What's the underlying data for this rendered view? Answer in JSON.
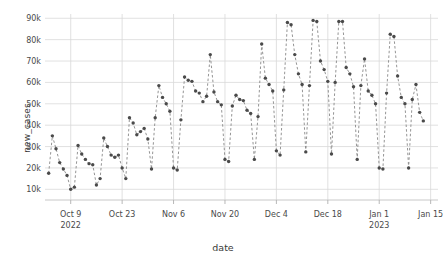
{
  "chart_data": {
    "type": "scatter",
    "title": "",
    "xlabel": "date",
    "ylabel": "new_cases",
    "ylim": [
      5000,
      92000
    ],
    "ytick_values": [
      10000,
      20000,
      30000,
      40000,
      50000,
      60000,
      70000,
      80000,
      90000
    ],
    "ytick_labels": [
      "10k",
      "20k",
      "30k",
      "40k",
      "50k",
      "60k",
      "70k",
      "80k",
      "90k"
    ],
    "xtick_labels": [
      "Oct 9\n2022",
      "Oct 23",
      "Nov 6",
      "Nov 20",
      "Dec 4",
      "Dec 18",
      "Jan 1\n2023",
      "Jan 15"
    ],
    "xtick_dates": [
      "2022-10-09",
      "2022-10-23",
      "2022-11-06",
      "2022-11-20",
      "2022-12-04",
      "2022-12-18",
      "2023-01-01",
      "2023-01-15"
    ],
    "xlim": [
      "2022-10-02",
      "2023-01-17"
    ],
    "grid": true,
    "legend": null,
    "marker_color": "#4a4a4a",
    "line_color": "#888888",
    "line_style": "dashed",
    "x": [
      "2022-10-03",
      "2022-10-04",
      "2022-10-05",
      "2022-10-06",
      "2022-10-07",
      "2022-10-08",
      "2022-10-09",
      "2022-10-10",
      "2022-10-11",
      "2022-10-12",
      "2022-10-13",
      "2022-10-14",
      "2022-10-15",
      "2022-10-16",
      "2022-10-17",
      "2022-10-18",
      "2022-10-19",
      "2022-10-20",
      "2022-10-21",
      "2022-10-22",
      "2022-10-23",
      "2022-10-24",
      "2022-10-25",
      "2022-10-26",
      "2022-10-27",
      "2022-10-28",
      "2022-10-29",
      "2022-10-30",
      "2022-10-31",
      "2022-11-01",
      "2022-11-02",
      "2022-11-03",
      "2022-11-04",
      "2022-11-05",
      "2022-11-06",
      "2022-11-07",
      "2022-11-08",
      "2022-11-09",
      "2022-11-10",
      "2022-11-11",
      "2022-11-12",
      "2022-11-13",
      "2022-11-14",
      "2022-11-15",
      "2022-11-16",
      "2022-11-17",
      "2022-11-18",
      "2022-11-19",
      "2022-11-20",
      "2022-11-21",
      "2022-11-22",
      "2022-11-23",
      "2022-11-24",
      "2022-11-25",
      "2022-11-26",
      "2022-11-27",
      "2022-11-28",
      "2022-11-29",
      "2022-11-30",
      "2022-12-01",
      "2022-12-02",
      "2022-12-03",
      "2022-12-04",
      "2022-12-05",
      "2022-12-06",
      "2022-12-07",
      "2022-12-08",
      "2022-12-09",
      "2022-12-10",
      "2022-12-11",
      "2022-12-12",
      "2022-12-13",
      "2022-12-14",
      "2022-12-15",
      "2022-12-16",
      "2022-12-17",
      "2022-12-18",
      "2022-12-19",
      "2022-12-20",
      "2022-12-21",
      "2022-12-22",
      "2022-12-23",
      "2022-12-24",
      "2022-12-25",
      "2022-12-26",
      "2022-12-27",
      "2022-12-28",
      "2022-12-29",
      "2022-12-30",
      "2022-12-31",
      "2023-01-01",
      "2023-01-02",
      "2023-01-03",
      "2023-01-04",
      "2023-01-05",
      "2023-01-06",
      "2023-01-07",
      "2023-01-08",
      "2023-01-09",
      "2023-01-10",
      "2023-01-11",
      "2023-01-12",
      "2023-01-13"
    ],
    "values": [
      17500,
      35000,
      29000,
      22500,
      19500,
      16500,
      10000,
      11000,
      30500,
      26500,
      24000,
      22000,
      21500,
      12000,
      15000,
      34000,
      30000,
      26000,
      25000,
      26000,
      20000,
      15000,
      43500,
      41000,
      35500,
      37000,
      38500,
      33500,
      19500,
      43500,
      58500,
      53000,
      50000,
      46500,
      20000,
      19000,
      42500,
      62500,
      61000,
      60500,
      56000,
      55000,
      51000,
      53500,
      73000,
      55500,
      51000,
      49500,
      24000,
      23000,
      49000,
      54000,
      52000,
      51500,
      47000,
      45500,
      24000,
      44000,
      78000,
      62000,
      59000,
      56000,
      28000,
      26000,
      56500,
      88000,
      87000,
      73000,
      64000,
      59000,
      27500,
      58500,
      89000,
      88500,
      70000,
      66000,
      60500,
      26500,
      60000,
      88500,
      88500,
      67000,
      64000,
      58000,
      24000,
      58500,
      71000,
      56000,
      54000,
      50000,
      20000,
      19500,
      55000,
      82500,
      81500,
      63000,
      53000,
      50000,
      20000,
      52000,
      59000,
      46000,
      42000
    ]
  }
}
